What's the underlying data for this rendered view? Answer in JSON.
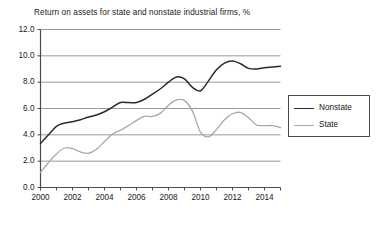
{
  "chart_data": {
    "type": "line",
    "title": "Return on assets for state and nonstate industrial firms, %",
    "xlabel": "",
    "ylabel": "",
    "xlim": [
      2000,
      2015
    ],
    "ylim": [
      0.0,
      12.0
    ],
    "ytick_labels": [
      "12.0",
      "10.0",
      "8.0",
      "6.0",
      "4.0",
      "2.0",
      "0.0"
    ],
    "ytick_values": [
      12.0,
      10.0,
      8.0,
      6.0,
      4.0,
      2.0,
      0.0
    ],
    "xtick_labels": [
      "2000",
      "2002",
      "2004",
      "2006",
      "2008",
      "2010",
      "2012",
      "2014"
    ],
    "xtick_values": [
      2000,
      2002,
      2004,
      2006,
      2008,
      2010,
      2012,
      2014
    ],
    "xtick_minor_values": [
      2001,
      2003,
      2005,
      2007,
      2009,
      2011,
      2013,
      2015
    ],
    "grid": "horizontal",
    "legend_position": "right",
    "colors": {
      "nonstate": "#2b2b2b",
      "state": "#a8a8a8",
      "grid": "#9a9a9a",
      "axis": "#4a4a4a",
      "background": "#ffffff"
    },
    "x": [
      2000,
      2000.5,
      2001,
      2001.5,
      2002,
      2002.5,
      2003,
      2003.5,
      2004,
      2004.5,
      2005,
      2005.5,
      2006,
      2006.5,
      2007,
      2007.5,
      2008,
      2008.5,
      2009,
      2009.5,
      2010,
      2010.5,
      2011,
      2011.5,
      2012,
      2012.5,
      2013,
      2013.5,
      2014,
      2014.5,
      2015
    ],
    "series": [
      {
        "name": "Nonstate",
        "color": "#2b2b2b",
        "values": [
          3.35,
          4.0,
          4.65,
          4.9,
          5.0,
          5.15,
          5.35,
          5.5,
          5.75,
          6.1,
          6.45,
          6.45,
          6.45,
          6.7,
          7.1,
          7.5,
          8.0,
          8.4,
          8.25,
          7.6,
          7.35,
          8.1,
          8.95,
          9.45,
          9.6,
          9.4,
          9.05,
          9.0,
          9.1,
          9.15,
          9.2
        ]
      },
      {
        "name": "State",
        "color": "#a8a8a8",
        "values": [
          1.15,
          1.9,
          2.55,
          3.0,
          2.95,
          2.7,
          2.6,
          2.9,
          3.5,
          4.05,
          4.35,
          4.7,
          5.1,
          5.4,
          5.4,
          5.65,
          6.25,
          6.65,
          6.6,
          5.8,
          4.2,
          3.85,
          4.4,
          5.15,
          5.6,
          5.7,
          5.3,
          4.75,
          4.7,
          4.7,
          4.55
        ]
      }
    ]
  },
  "legend": {
    "entries": [
      {
        "label": "Nonstate"
      },
      {
        "label": "State"
      }
    ]
  }
}
